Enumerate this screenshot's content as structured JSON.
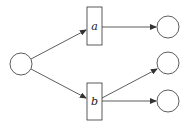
{
  "diagram": {
    "type": "petri-net",
    "places": [
      {
        "id": "p0",
        "cx": 21,
        "cy": 64,
        "r": 11
      },
      {
        "id": "p1",
        "cx": 168,
        "cy": 27,
        "r": 11
      },
      {
        "id": "p2",
        "cx": 168,
        "cy": 63,
        "r": 11
      },
      {
        "id": "p3",
        "cx": 168,
        "cy": 101,
        "r": 11
      }
    ],
    "transitions": [
      {
        "id": "a",
        "label": "a",
        "x": 87,
        "y": 7,
        "w": 15,
        "h": 38
      },
      {
        "id": "b",
        "label": "b",
        "x": 87,
        "y": 83,
        "w": 15,
        "h": 37
      }
    ],
    "arcs": [
      {
        "from": "p0",
        "to": "a"
      },
      {
        "from": "p0",
        "to": "b"
      },
      {
        "from": "a",
        "to": "p1"
      },
      {
        "from": "b",
        "to": "p2"
      },
      {
        "from": "b",
        "to": "p3"
      }
    ],
    "colors": {
      "stroke": "#333333",
      "fill": "#ffffff"
    }
  }
}
